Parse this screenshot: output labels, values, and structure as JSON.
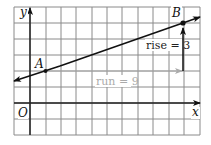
{
  "figure": {
    "type": "coordinate-plane-slope-diagram",
    "grid": {
      "x_min": -1,
      "x_max": 11,
      "y_min": -2,
      "y_max": 6,
      "unit_px_x": 15.5,
      "unit_px_y": 16,
      "origin_px": [
        30,
        103
      ],
      "grid_color": "#8a8a8a",
      "axis_color": "#222222"
    },
    "axes": {
      "x_label": "x",
      "y_label": "y",
      "origin_label": "O"
    },
    "points": [
      {
        "name": "A",
        "label": "A",
        "x": 1,
        "y": 2
      },
      {
        "name": "B",
        "label": "B",
        "x": 10,
        "y": 5
      }
    ],
    "line": {
      "from": [
        -1,
        1.667
      ],
      "to": [
        11,
        5.667
      ],
      "color": "#111111"
    },
    "run_arrow": {
      "from": [
        1,
        2
      ],
      "to": [
        10,
        2
      ],
      "label": "run = 9",
      "color": "#aaaaaa"
    },
    "rise_arrow": {
      "from": [
        10,
        2
      ],
      "to": [
        10,
        5
      ],
      "label": "rise = 3",
      "color": "#111111"
    }
  }
}
